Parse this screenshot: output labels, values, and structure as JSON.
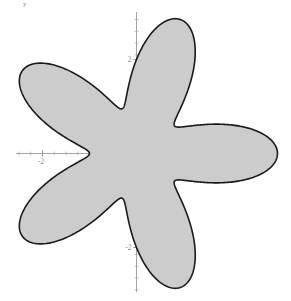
{
  "figure": {
    "kind": "polar-rose-curve-plot",
    "corner_label": "y",
    "background_color": "#ffffff",
    "fill_color": "#cccccc",
    "stroke_color": "#1a1a1a",
    "axis_color": "#9a9a9a",
    "tick_label_color": "#8f8f8f",
    "stroke_width": 1.6
  },
  "chart_data": {
    "type": "line",
    "title": "",
    "xlabel": "",
    "ylabel": "y",
    "grid": false,
    "legend": "none",
    "curve_name": "polar rose r = 2 + cos(5θ)",
    "petal_count": 5,
    "xlim": [
      -2.85,
      2.9
    ],
    "ylim": [
      -3.0,
      3.0
    ],
    "xticks": [
      -2,
      -1,
      1,
      2
    ],
    "xtick_labels": [
      "-2",
      "-1",
      "1",
      "2"
    ],
    "yticks": [
      -2,
      -1,
      1,
      2
    ],
    "ytick_labels": [
      "-2",
      "-1",
      "1",
      "2"
    ],
    "x_minor_tick_step": 0.25,
    "y_minor_tick_step": 0.25,
    "polar": {
      "r_max": 3.0,
      "r_min": 1.0,
      "k": 5,
      "a": 2.0,
      "b": 1.0,
      "phase_deg": 72,
      "petal_tip_angles_deg": [
        72,
        144,
        216,
        288,
        360
      ],
      "valley_angles_deg": [
        36,
        108,
        180,
        252,
        324
      ]
    },
    "notable_points": {
      "center_px": [
        136,
        153
      ],
      "units_per_px": 0.0213,
      "top_petal_tip": [
        -0.77,
        2.79
      ],
      "right_petal_tip": [
        2.89,
        0.92
      ],
      "lower_right_petal_tip": [
        0.94,
        -2.87
      ],
      "lower_left_petal_tip": [
        -2.47,
        -1.77
      ],
      "upper_left_petal_tip": [
        -2.47,
        1.78
      ]
    }
  }
}
